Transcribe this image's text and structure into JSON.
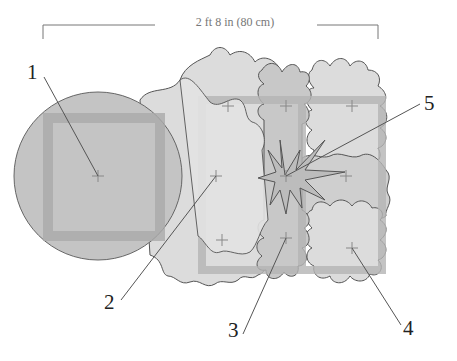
{
  "dimension": {
    "label": "2 ft 8 in (80 cm)"
  },
  "callouts": [
    {
      "number": "1",
      "x": 27,
      "y": 62
    },
    {
      "number": "2",
      "x": 104,
      "y": 292
    },
    {
      "number": "3",
      "x": 228,
      "y": 320
    },
    {
      "number": "4",
      "x": 403,
      "y": 318
    },
    {
      "number": "5",
      "x": 424,
      "y": 93
    }
  ],
  "colors": {
    "circle_fill": "#c4c4c4",
    "tile_fill": "#dcdcdc",
    "tile_dark": "#bdbdbd",
    "band": "#b5b5b5",
    "outline": "#555555",
    "leader": "#555555"
  }
}
